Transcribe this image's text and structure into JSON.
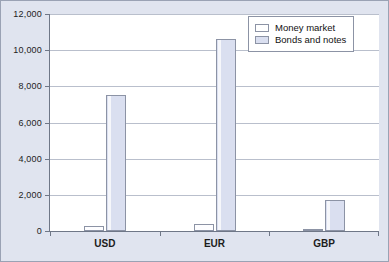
{
  "chart_data": {
    "type": "bar",
    "title": "",
    "xlabel": "",
    "ylabel": "",
    "categories": [
      "USD",
      "EUR",
      "GBP"
    ],
    "series": [
      {
        "name": "Money market",
        "values": [
          300,
          400,
          100
        ],
        "color": "#ffffff"
      },
      {
        "name": "Bonds and notes",
        "values": [
          7500,
          10600,
          1700
        ],
        "color": "#dadff0"
      }
    ],
    "ylim": [
      0,
      12000
    ],
    "ytick_values": [
      0,
      2000,
      4000,
      6000,
      8000,
      10000,
      12000
    ],
    "ytick_labels": [
      "0",
      "2,000",
      "4,000",
      "6,000",
      "8,000",
      "10,000",
      "12,000"
    ],
    "grid": true,
    "legend_position": "top-right"
  },
  "legend": {
    "entries": [
      {
        "label": "Money market"
      },
      {
        "label": "Bonds and notes"
      }
    ]
  },
  "colors": {
    "figure_background": "#e0e4ef",
    "plot_background": "#ffffff",
    "axis": "#6f7787",
    "gridline": "#b9bfcc",
    "bar_border": "#8c93a5",
    "text": "#1c1c1c"
  }
}
